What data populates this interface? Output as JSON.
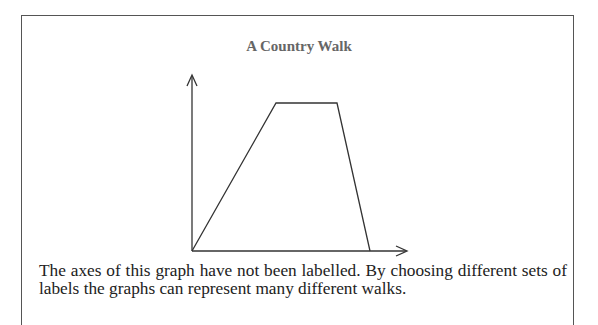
{
  "chart_data": {
    "type": "line",
    "title": "A Country Walk",
    "xlabel": "",
    "ylabel": "",
    "axes_labelled": false,
    "grid": false,
    "legend": null,
    "x": [
      0,
      84,
      145,
      178
    ],
    "y": [
      0,
      148,
      148,
      0
    ],
    "note": "Unlabelled axes; trapezoid shape: linear rise, flat plateau, steep linear fall back to zero (values in relative pixel units)."
  },
  "figure": {
    "title": "A Country Walk",
    "caption_line1": "The axes of this graph have not been labelled. By choosing different sets of",
    "caption_line2": "labels the graphs can represent many different walks."
  },
  "colors": {
    "line": "#333333",
    "title": "#666666",
    "text": "#222222",
    "frame": "#555555"
  }
}
